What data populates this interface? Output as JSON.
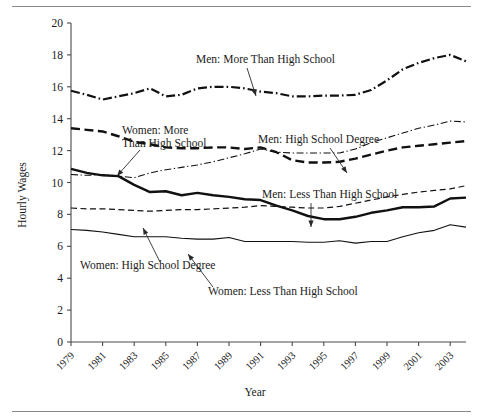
{
  "figure": {
    "has_top_rule": true,
    "has_bottom_rule": true,
    "background": "#ffffff",
    "line_color": "#111111"
  },
  "chart_data": {
    "type": "line",
    "title": "",
    "xlabel": "Year",
    "ylabel": "Hourly Wages",
    "xlim": [
      1979,
      2004
    ],
    "ylim": [
      0,
      20
    ],
    "ytick_labels": [
      "0",
      "2",
      "4",
      "6",
      "8",
      "10",
      "12",
      "14",
      "16",
      "18",
      "20"
    ],
    "yticks": [
      0,
      2,
      4,
      6,
      8,
      10,
      12,
      14,
      16,
      18,
      20
    ],
    "xtick_labels": [
      "1979",
      "1981",
      "1983",
      "1985",
      "1987",
      "1989",
      "1991",
      "1993",
      "1995",
      "1997",
      "1999",
      "2001",
      "2003"
    ],
    "xticks": [
      1979,
      1981,
      1983,
      1985,
      1987,
      1989,
      1991,
      1993,
      1995,
      1997,
      1999,
      2001,
      2003
    ],
    "grid": false,
    "legend": "inline-annotations",
    "x": [
      1979,
      1980,
      1981,
      1982,
      1983,
      1984,
      1985,
      1986,
      1987,
      1988,
      1989,
      1990,
      1991,
      1992,
      1993,
      1994,
      1995,
      1996,
      1997,
      1998,
      1999,
      2000,
      2001,
      2002,
      2003,
      2004
    ],
    "series": [
      {
        "name": "Men: More Than High School",
        "style": "dash-dot",
        "width": 2.2,
        "values": [
          15.75,
          15.5,
          15.2,
          15.4,
          15.6,
          15.9,
          15.4,
          15.5,
          15.9,
          16.0,
          16.0,
          15.9,
          15.7,
          15.6,
          15.4,
          15.4,
          15.45,
          15.45,
          15.5,
          15.8,
          16.4,
          17.1,
          17.5,
          17.8,
          18.0,
          17.6
        ]
      },
      {
        "name": "Women: More Than High School",
        "style": "dashed",
        "width": 2.4,
        "values": [
          13.4,
          13.3,
          13.2,
          12.9,
          12.55,
          12.4,
          12.2,
          12.15,
          12.15,
          12.2,
          12.2,
          12.1,
          12.2,
          11.9,
          11.4,
          11.25,
          11.25,
          11.3,
          11.5,
          11.75,
          12.0,
          12.2,
          12.3,
          12.4,
          12.5,
          12.6
        ]
      },
      {
        "name": "Men: High School Degree",
        "style": "thin-dash-dot",
        "width": 1.1,
        "values": [
          10.5,
          10.45,
          10.5,
          10.4,
          10.3,
          10.6,
          10.8,
          10.95,
          11.1,
          11.3,
          11.55,
          11.8,
          12.1,
          11.9,
          11.85,
          11.85,
          11.85,
          11.85,
          12.1,
          12.5,
          12.8,
          13.1,
          13.4,
          13.6,
          13.85,
          13.8
        ]
      },
      {
        "name": "Men: Less Than High School",
        "style": "solid",
        "width": 2.4,
        "values": [
          10.85,
          10.6,
          10.45,
          10.4,
          9.85,
          9.4,
          9.45,
          9.2,
          9.35,
          9.2,
          9.1,
          8.95,
          8.9,
          8.55,
          8.25,
          7.9,
          7.7,
          7.7,
          7.85,
          8.1,
          8.25,
          8.45,
          8.45,
          8.5,
          9.0,
          9.05
        ]
      },
      {
        "name": "Women: High School Degree",
        "style": "thin-dashed",
        "width": 1.2,
        "values": [
          8.4,
          8.35,
          8.35,
          8.3,
          8.25,
          8.2,
          8.25,
          8.3,
          8.3,
          8.35,
          8.4,
          8.45,
          8.55,
          8.5,
          8.45,
          8.4,
          8.4,
          8.5,
          8.7,
          8.9,
          9.1,
          9.25,
          9.4,
          9.5,
          9.6,
          9.8
        ]
      },
      {
        "name": "Women: Less Than High School",
        "style": "thin-solid",
        "width": 1.1,
        "values": [
          7.05,
          7.0,
          6.9,
          6.75,
          6.6,
          6.6,
          6.6,
          6.5,
          6.45,
          6.45,
          6.55,
          6.3,
          6.3,
          6.3,
          6.3,
          6.25,
          6.25,
          6.35,
          6.2,
          6.3,
          6.3,
          6.6,
          6.85,
          7.0,
          7.35,
          7.2
        ]
      }
    ],
    "annotations": [
      {
        "text": "Men: More Than High School",
        "lines": [
          "Men: More Than High School"
        ],
        "target_series": "Men: More Than High School"
      },
      {
        "text": "Women: More Than High School",
        "lines": [
          "Women: More",
          "Than High School"
        ],
        "target_series": "Women: More Than High School"
      },
      {
        "text": "Men: High School Degree",
        "lines": [
          "Men: High School Degree"
        ],
        "target_series": "Men: High School Degree"
      },
      {
        "text": "Men: Less Than High School",
        "lines": [
          "Men: Less Than High School"
        ],
        "target_series": "Men: Less Than High School"
      },
      {
        "text": "Women: High School Degree",
        "lines": [
          "Women: High School Degree"
        ],
        "target_series": "Women: High School Degree"
      },
      {
        "text": "Women: Less Than High School",
        "lines": [
          "Women: Less Than High School"
        ],
        "target_series": "Women: Less Than High School"
      }
    ]
  }
}
